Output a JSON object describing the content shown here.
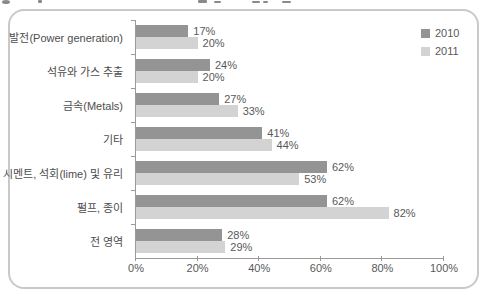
{
  "chart_data": {
    "type": "bar",
    "orientation": "horizontal",
    "title": "",
    "xlabel": "",
    "ylabel": "",
    "categories": [
      "발전(Power generation)",
      "석유와 가스 추출",
      "금속(Metals)",
      "기타",
      "시멘트, 석회(lime) 및 유리",
      "펄프, 종이",
      "전 영역"
    ],
    "series": [
      {
        "name": "2010",
        "color": "#949494",
        "values": [
          17,
          24,
          27,
          41,
          62,
          62,
          28
        ]
      },
      {
        "name": "2011",
        "color": "#d3d3d3",
        "values": [
          20,
          20,
          33,
          44,
          53,
          82,
          29
        ]
      }
    ],
    "value_label_format": "{v}%",
    "xlim": [
      0,
      100
    ],
    "x_tick_labels": [
      "0%",
      "20%",
      "40%",
      "60%",
      "80%",
      "100%"
    ],
    "grid": false,
    "legend_position": "top-right",
    "axis_color": "#9a9a9a",
    "label_color": "#595959"
  }
}
